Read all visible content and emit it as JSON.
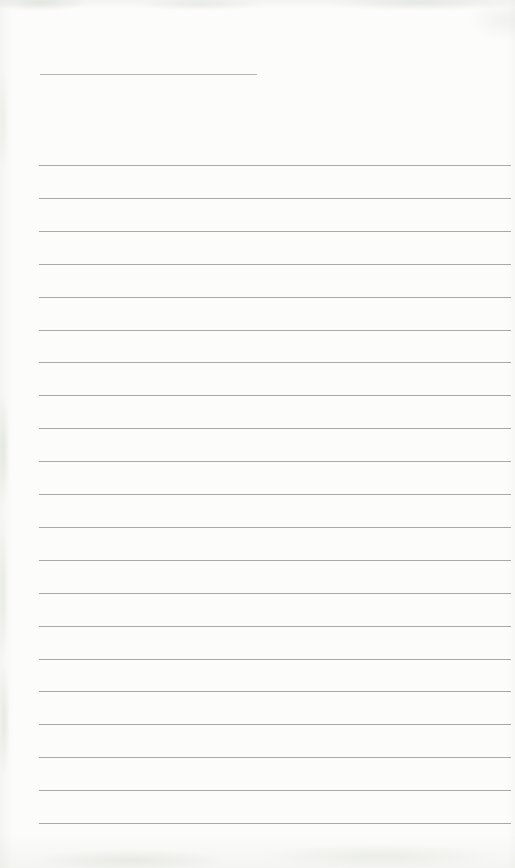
{
  "page": {
    "kind": "blank-ruled-notebook-page",
    "visible_text": "",
    "paper_color": "#fcfcfa",
    "edge_texture_color": "#a5ac9e",
    "title_rule": {
      "x": 40,
      "y": 74,
      "width": 217,
      "thickness": 1,
      "color": "#b4b5b2"
    },
    "ruled_lines": {
      "count": 21,
      "x_start": 39,
      "x_end": 511,
      "first_y": 165,
      "spacing": 32.9,
      "thickness": 1,
      "color": "#a8a9a6"
    }
  }
}
